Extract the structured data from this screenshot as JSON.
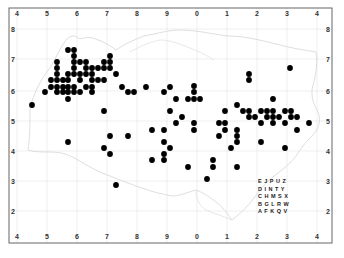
{
  "map": {
    "title": "",
    "frame": {
      "x0": 9,
      "y0": 8,
      "x1": 332,
      "y1": 243
    },
    "x_ticks": [
      {
        "label": "4",
        "px": 17
      },
      {
        "label": "5",
        "px": 47
      },
      {
        "label": "6",
        "px": 77
      },
      {
        "label": "7",
        "px": 107
      },
      {
        "label": "8",
        "px": 137
      },
      {
        "label": "9",
        "px": 167
      },
      {
        "label": "0",
        "px": 197
      },
      {
        "label": "1",
        "px": 227
      },
      {
        "label": "2",
        "px": 257
      },
      {
        "label": "3",
        "px": 287
      },
      {
        "label": "4",
        "px": 317
      }
    ],
    "y_ticks": [
      {
        "label": "8",
        "px": 29
      },
      {
        "label": "7",
        "px": 59
      },
      {
        "label": "6",
        "px": 91
      },
      {
        "label": "5",
        "px": 121
      },
      {
        "label": "4",
        "px": 151
      },
      {
        "label": "3",
        "px": 181
      },
      {
        "label": "2",
        "px": 211
      }
    ],
    "tetrad_key": {
      "rows": [
        "E J P U Z",
        "D I N T Y",
        "C H M S X",
        "B G L R W",
        "A F K Q V"
      ],
      "x": 258,
      "y": 183
    },
    "dot_color": "#000000",
    "grid_color": "#e4e4e4",
    "coast_color": "#d9d9d9",
    "dots": [
      [
        68,
        50
      ],
      [
        74,
        50
      ],
      [
        74,
        56
      ],
      [
        110,
        56
      ],
      [
        57,
        62
      ],
      [
        74,
        62
      ],
      [
        80,
        62
      ],
      [
        86,
        62
      ],
      [
        104,
        62
      ],
      [
        110,
        62
      ],
      [
        57,
        68
      ],
      [
        74,
        68
      ],
      [
        86,
        68
      ],
      [
        92,
        68
      ],
      [
        98,
        68
      ],
      [
        104,
        68
      ],
      [
        110,
        68
      ],
      [
        57,
        74
      ],
      [
        68,
        74
      ],
      [
        74,
        74
      ],
      [
        80,
        74
      ],
      [
        86,
        74
      ],
      [
        92,
        74
      ],
      [
        116,
        74
      ],
      [
        51,
        80
      ],
      [
        57,
        80
      ],
      [
        63,
        80
      ],
      [
        68,
        80
      ],
      [
        80,
        80
      ],
      [
        92,
        80
      ],
      [
        98,
        80
      ],
      [
        104,
        80
      ],
      [
        51,
        87
      ],
      [
        57,
        87
      ],
      [
        63,
        87
      ],
      [
        68,
        87
      ],
      [
        74,
        87
      ],
      [
        86,
        87
      ],
      [
        92,
        87
      ],
      [
        122,
        87
      ],
      [
        146,
        87
      ],
      [
        170,
        87
      ],
      [
        194,
        86
      ],
      [
        45,
        92
      ],
      [
        57,
        92
      ],
      [
        63,
        92
      ],
      [
        68,
        92
      ],
      [
        74,
        92
      ],
      [
        80,
        92
      ],
      [
        92,
        92
      ],
      [
        128,
        92
      ],
      [
        134,
        92
      ],
      [
        164,
        92
      ],
      [
        194,
        92
      ],
      [
        68,
        99
      ],
      [
        176,
        99
      ],
      [
        188,
        99
      ],
      [
        194,
        99
      ],
      [
        200,
        99
      ],
      [
        273,
        99
      ],
      [
        32,
        105
      ],
      [
        237,
        105
      ],
      [
        104,
        111
      ],
      [
        170,
        111
      ],
      [
        225,
        111
      ],
      [
        243,
        111
      ],
      [
        249,
        111
      ],
      [
        261,
        111
      ],
      [
        267,
        111
      ],
      [
        273,
        111
      ],
      [
        285,
        111
      ],
      [
        291,
        111
      ],
      [
        182,
        117
      ],
      [
        249,
        117
      ],
      [
        255,
        117
      ],
      [
        267,
        117
      ],
      [
        273,
        117
      ],
      [
        279,
        117
      ],
      [
        291,
        117
      ],
      [
        297,
        117
      ],
      [
        176,
        123
      ],
      [
        194,
        123
      ],
      [
        219,
        123
      ],
      [
        225,
        123
      ],
      [
        261,
        123
      ],
      [
        273,
        123
      ],
      [
        285,
        123
      ],
      [
        309,
        123
      ],
      [
        152,
        130
      ],
      [
        164,
        130
      ],
      [
        194,
        130
      ],
      [
        225,
        130
      ],
      [
        237,
        130
      ],
      [
        297,
        130
      ],
      [
        110,
        136
      ],
      [
        128,
        136
      ],
      [
        219,
        136
      ],
      [
        237,
        136
      ],
      [
        68,
        142
      ],
      [
        164,
        142
      ],
      [
        237,
        142
      ],
      [
        261,
        142
      ],
      [
        104,
        148
      ],
      [
        170,
        148
      ],
      [
        231,
        148
      ],
      [
        285,
        148
      ],
      [
        110,
        154
      ],
      [
        164,
        154
      ],
      [
        152,
        160
      ],
      [
        164,
        160
      ],
      [
        213,
        160
      ],
      [
        188,
        167
      ],
      [
        213,
        167
      ],
      [
        237,
        167
      ],
      [
        207,
        179
      ],
      [
        116,
        185
      ],
      [
        290,
        68
      ],
      [
        249,
        74
      ],
      [
        249,
        80
      ]
    ]
  }
}
